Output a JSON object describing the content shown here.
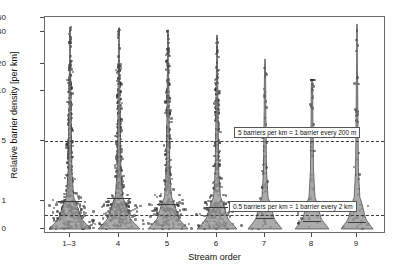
{
  "chart_data": {
    "type": "scatter",
    "title": "",
    "subtitle": "",
    "xlabel": "Stream order",
    "ylabel": "Relative barrier density [per km]",
    "categories": [
      "1–3",
      "4",
      "5",
      "6",
      "7",
      "8",
      "9"
    ],
    "yticks": [
      0,
      1,
      5,
      10,
      20,
      40,
      60
    ],
    "ytick_labels": [
      "0",
      "1",
      "5",
      "10",
      "20",
      "40",
      "60"
    ],
    "ylim": [
      0,
      60
    ],
    "y_scale": "nonlinear (compressed at high values)",
    "grid": false,
    "legend": false,
    "plot_style": "violin plus jittered scatter overlay",
    "point_color": "#2d2d2d",
    "violin_fill": "#9a9a9a",
    "violin_edge": "#3a3a3a",
    "reference_lines": [
      {
        "value": 5,
        "label": "5 barriers per km = 1 barrier every 200 m",
        "style": "dash-dot"
      },
      {
        "value": 0.5,
        "label": "0.5 barriers per km = 1 barrier every 2 km",
        "style": "dash-dot"
      }
    ],
    "annotations": [
      {
        "text": "5 barriers per km = 1 barrier every 200 m",
        "near_y": 5
      },
      {
        "text": "0.5 barriers per km = 1 barrier every 2 km",
        "near_y": 0.5
      }
    ],
    "series": [
      {
        "name": "1–3",
        "n_label": "1–3",
        "median": 1.0,
        "max": 47,
        "violin_half_width_px": 21,
        "notes": "widest distribution, dense mass below 5 per km"
      },
      {
        "name": "4",
        "median": 1.2,
        "max": 46,
        "violin_half_width_px": 21
      },
      {
        "name": "5",
        "median": 0.9,
        "max": 43,
        "violin_half_width_px": 20
      },
      {
        "name": "6",
        "median": 0.8,
        "max": 38,
        "violin_half_width_px": 20
      },
      {
        "name": "7",
        "median": 0.4,
        "max": 23,
        "violin_half_width_px": 17
      },
      {
        "name": "8",
        "median": 0.3,
        "max": 14,
        "violin_half_width_px": 17
      },
      {
        "name": "9",
        "median": 0.25,
        "max": 51,
        "violin_half_width_px": 16
      }
    ]
  }
}
